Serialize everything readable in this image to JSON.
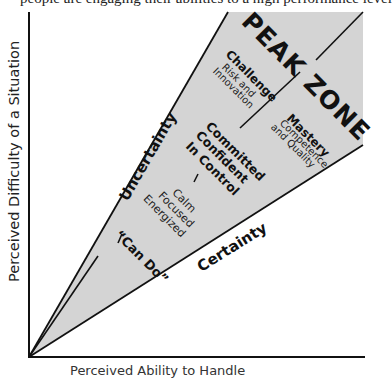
{
  "figure": {
    "type": "flow-zone-diagram",
    "top_caption_cutoff": "people are engaging their abilities to a high performance level",
    "fill_color": "#d4d4d4",
    "line_color": "#111111"
  },
  "axes": {
    "y_label": "Perceived Difficulty of a Situation",
    "x_label_cutoff": "Perceived Ability to Handle"
  },
  "boundaries": {
    "upper": "Uncertainty",
    "lower": "Certainty"
  },
  "zone": {
    "title": "PEAK ZONE",
    "challenge": {
      "heading": "Challenge",
      "line1": "Risk and",
      "line2": "Innovation"
    },
    "mastery": {
      "heading": "Mastery",
      "line1": "Competence",
      "line2": "and Quality"
    }
  },
  "center_stack": {
    "upper": [
      "Committed",
      "Confident",
      "In Control"
    ],
    "middle": [
      "Calm",
      "Focused",
      "Energized"
    ],
    "lower": "“Can Do”",
    "separator": "–"
  }
}
